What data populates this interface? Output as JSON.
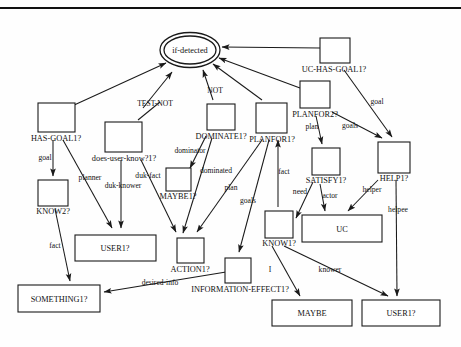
{
  "figure": {
    "type": "semantic-network-diagram",
    "title_rule": true,
    "colors": {
      "stroke": "#1a1a1a",
      "background": "#ffffff"
    }
  },
  "nodes": {
    "if_detected": {
      "label": "if-detected",
      "shape": "double-ellipse",
      "cx": 190,
      "cy": 50,
      "rx": 30,
      "ry": 17
    },
    "has_goal1": {
      "label": "HAS-GOAL1?",
      "shape": "box",
      "x": 38,
      "y": 103,
      "w": 37,
      "h": 29,
      "label_pos": "below"
    },
    "does_user_know1": {
      "label": "does-user-know?1?",
      "shape": "box",
      "x": 105,
      "y": 122,
      "w": 37,
      "h": 30,
      "label_pos": "below"
    },
    "know2": {
      "label": "KNOW2?",
      "shape": "box",
      "x": 38,
      "y": 180,
      "w": 30,
      "h": 26,
      "label_pos": "below"
    },
    "maybe1": {
      "label": "MAYBE1?",
      "shape": "box",
      "x": 166,
      "y": 168,
      "w": 25,
      "h": 23,
      "label_pos": "below"
    },
    "dominate1": {
      "label": "DOMINATE1?",
      "shape": "box",
      "x": 207,
      "y": 104,
      "w": 28,
      "h": 26,
      "label_pos": "below"
    },
    "planfor1": {
      "label": "PLANFOR1?",
      "shape": "box",
      "x": 256,
      "y": 103,
      "w": 31,
      "h": 30,
      "label_pos": "below"
    },
    "uc_has_goal1": {
      "label": "UC-HAS-GOAL1?",
      "shape": "box",
      "x": 320,
      "y": 38,
      "w": 30,
      "h": 25,
      "label_pos": "below"
    },
    "planfor2": {
      "label": "PLANFOR2?",
      "shape": "box",
      "x": 300,
      "y": 81,
      "w": 30,
      "h": 27,
      "label_pos": "below"
    },
    "satisfy1": {
      "label": "SATISFY1?",
      "shape": "box",
      "x": 312,
      "y": 148,
      "w": 28,
      "h": 27,
      "label_pos": "below"
    },
    "help1": {
      "label": "HELP1?",
      "shape": "box",
      "x": 378,
      "y": 142,
      "w": 32,
      "h": 31,
      "label_pos": "below"
    },
    "know1": {
      "label": "KNOW1?",
      "shape": "box",
      "x": 265,
      "y": 211,
      "w": 28,
      "h": 27,
      "label_pos": "below"
    },
    "action1": {
      "label": "ACTION1?",
      "shape": "box",
      "x": 177,
      "y": 238,
      "w": 27,
      "h": 25,
      "label_pos": "below"
    },
    "information_effect1": {
      "label": "INFORMATION-EFFECT1?",
      "shape": "box",
      "x": 225,
      "y": 258,
      "w": 26,
      "h": 25,
      "label_pos": "below"
    },
    "user1_left": {
      "label": "USER1?",
      "shape": "box",
      "x": 75,
      "y": 235,
      "w": 81,
      "h": 26,
      "label_pos": "inside"
    },
    "uc": {
      "label": "UC",
      "shape": "box",
      "x": 302,
      "y": 215,
      "w": 80,
      "h": 27,
      "label_pos": "inside"
    },
    "something1": {
      "label": "SOMETHING1?",
      "shape": "box",
      "x": 18,
      "y": 285,
      "w": 82,
      "h": 27,
      "label_pos": "inside"
    },
    "maybe": {
      "label": "MAYBE",
      "shape": "box",
      "x": 272,
      "y": 300,
      "w": 80,
      "h": 26,
      "label_pos": "inside"
    },
    "user1_right": {
      "label": "USER1?",
      "shape": "box",
      "x": 362,
      "y": 300,
      "w": 78,
      "h": 26,
      "label_pos": "inside"
    }
  },
  "edge_labels": {
    "test_not": "TEST-NOT",
    "not": "NOT",
    "goal_left": "goal",
    "planner": "planner",
    "duk_fact": "duk-fact",
    "duk_knower": "duk-knower",
    "dominator": "dominator",
    "dominated": "dominated",
    "plan_left": "plan",
    "goals_left": "goals",
    "fact_center": "fact",
    "fact_left": "fact",
    "plan_right": "plan",
    "goals_right": "goals",
    "goal_right": "goal",
    "need": "need",
    "actor": "actor",
    "helper": "helper",
    "helpee": "helpee",
    "desired_info": "desired-info",
    "i": "I",
    "knower": "knower"
  }
}
